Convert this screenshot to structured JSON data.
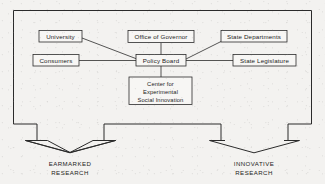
{
  "figure": {
    "type": "organizational-flow-diagram",
    "background_color": "#f3f2f0",
    "line_color": "#2b2b2b",
    "box_fill_color": "#f7f6f4"
  },
  "nodes": {
    "university": {
      "label": "University"
    },
    "consumers": {
      "label": "Consumers"
    },
    "office_of_governor": {
      "label": "Office of Governor"
    },
    "policy_board": {
      "label": "Policy Board"
    },
    "state_departments": {
      "label": "State Departments"
    },
    "state_legislature": {
      "label": "State Legislature"
    },
    "center": {
      "line1": "Center for",
      "line2": "Experimental",
      "line3": "Social Innovation"
    }
  },
  "outcomes": {
    "left": {
      "line1": "EARMARKED",
      "line2": "RESEARCH"
    },
    "right": {
      "line1": "INNOVATIVE",
      "line2": "RESEARCH"
    }
  },
  "connections": [
    {
      "from": "university",
      "to": "policy_board"
    },
    {
      "from": "consumers",
      "to": "policy_board"
    },
    {
      "from": "office_of_governor",
      "to": "policy_board"
    },
    {
      "from": "state_departments",
      "to": "policy_board"
    },
    {
      "from": "state_legislature",
      "to": "policy_board"
    },
    {
      "from": "policy_board",
      "to": "center"
    }
  ]
}
